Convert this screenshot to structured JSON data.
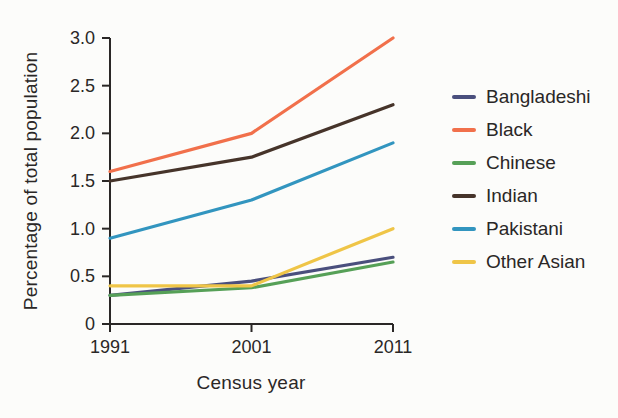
{
  "chart_data": {
    "type": "line",
    "title": "",
    "xlabel": "Census year",
    "ylabel": "Percentage of total population",
    "x": [
      1991,
      2001,
      2011
    ],
    "x_tick_labels": [
      "1991",
      "2001",
      "2011"
    ],
    "ylim": [
      0,
      3.0
    ],
    "yticks": [
      0,
      0.5,
      1.0,
      1.5,
      2.0,
      2.5,
      3.0
    ],
    "ytick_labels": [
      "0",
      "0.5",
      "1.0",
      "1.5",
      "2.0",
      "2.5",
      "3.0"
    ],
    "grid": false,
    "legend_position": "right",
    "series": [
      {
        "name": "Bangladeshi",
        "color": "#4a4f7d",
        "values": [
          0.3,
          0.45,
          0.7
        ]
      },
      {
        "name": "Black",
        "color": "#f1704b",
        "values": [
          1.6,
          2.0,
          3.0
        ]
      },
      {
        "name": "Chinese",
        "color": "#56a057",
        "values": [
          0.3,
          0.38,
          0.65
        ]
      },
      {
        "name": "Indian",
        "color": "#46342a",
        "values": [
          1.5,
          1.75,
          2.3
        ]
      },
      {
        "name": "Pakistani",
        "color": "#3295bf",
        "values": [
          0.9,
          1.3,
          1.9
        ]
      },
      {
        "name": "Other Asian",
        "color": "#efc547",
        "values": [
          0.4,
          0.4,
          1.0
        ]
      }
    ]
  },
  "colors": {
    "axis": "#2a2726",
    "text": "#2a2726",
    "background": "#fcfcfa"
  }
}
